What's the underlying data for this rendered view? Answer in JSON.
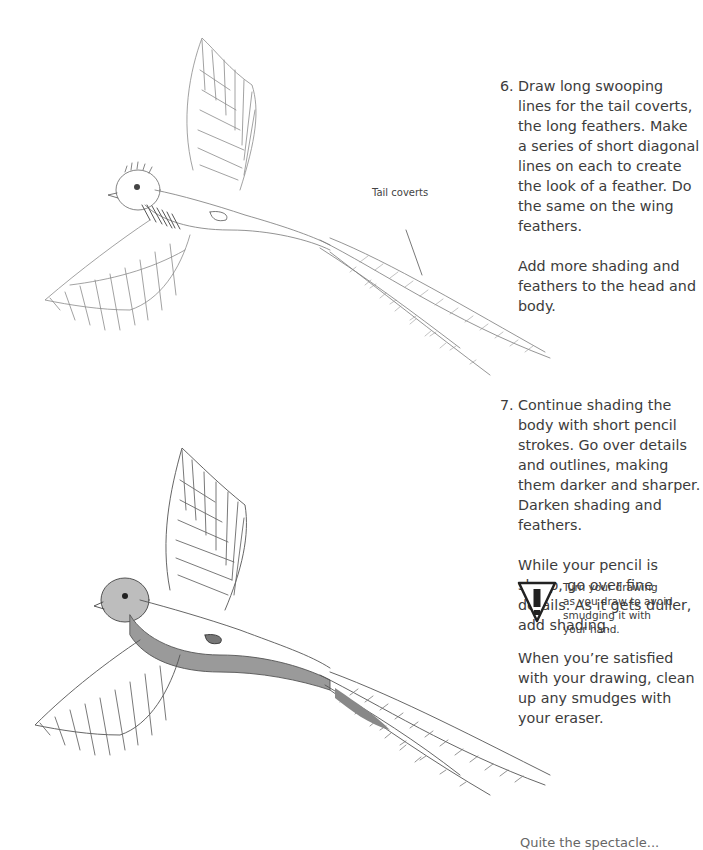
{
  "steps": [
    {
      "number": "6.",
      "paragraphs": [
        "Draw long swooping lines for the tail coverts, the long feathers. Make a series of short diagonal lines on each to create the look of a feather. Do the same on the wing feathers.",
        "Add more shading and feathers to the head and body."
      ]
    },
    {
      "number": "7.",
      "paragraphs": [
        "Continue shading the body with short pencil strokes. Go over details and outlines, making them darker and sharper. Darken shading and feathers.",
        "While your pencil is sharp, go over fine details. As it gets duller, add shading.",
        "When you’re satisfied with your drawing, clean up any smudges with your eraser."
      ]
    }
  ],
  "callout": {
    "label": "Tail coverts"
  },
  "tip": {
    "icon": "warning-icon",
    "text": "Turn your drawing as you draw to avoid smudging it with your hand."
  },
  "cut_off_text": "Quite the spectacle...",
  "figures": [
    {
      "name": "quetzal-sketch-step-6",
      "description": "Pencil sketch of a flying quetzal with long tail coverts, light shading"
    },
    {
      "name": "quetzal-sketch-step-7",
      "description": "Pencil sketch of a flying quetzal with darker shading and feathers"
    }
  ]
}
